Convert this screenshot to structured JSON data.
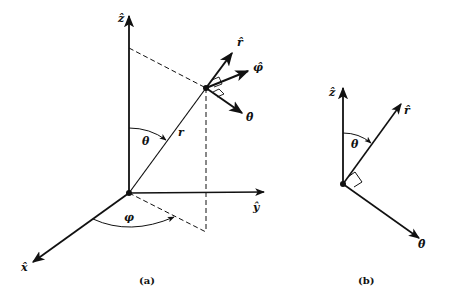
{
  "figure_a": {
    "caption": "(a)",
    "axes": {
      "z_label": "ẑ",
      "y_label": "ŷ",
      "x_label": "x̂"
    },
    "point_vector_label": "r",
    "polar_angle_label": "θ",
    "azimuth_angle_label": "φ",
    "unit_vectors": {
      "r_hat": "r̂",
      "phi_hat": "φ̂",
      "theta_hat": "θ̂"
    }
  },
  "figure_b": {
    "caption": "(b)",
    "z_label": "ẑ",
    "r_hat": "r̂",
    "theta_hat": "θ̂",
    "polar_angle_label": "θ"
  },
  "colors": {
    "ink": "#111111",
    "background": "#ffffff"
  }
}
